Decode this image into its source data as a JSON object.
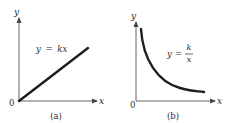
{
  "panels": [
    {
      "id": "a",
      "caption": "(a)",
      "equation": "y = kx",
      "equation_parts": {
        "lhs": "y",
        "eq": "=",
        "rhs": "kx"
      },
      "x_axis_label": "x",
      "y_axis_label": "y",
      "origin_label": "0",
      "curve": "linear"
    },
    {
      "id": "b",
      "caption": "(b)",
      "equation": "y = k/x",
      "equation_parts": {
        "lhs": "y",
        "eq": "=",
        "numerator": "k",
        "denominator": "x"
      },
      "x_axis_label": "x",
      "y_axis_label": "y",
      "origin_label": "0",
      "curve": "hyperbolic"
    }
  ],
  "colors": {
    "axis": "#555555",
    "curve": "#1e1e1e",
    "text": "#2a2a2a"
  }
}
